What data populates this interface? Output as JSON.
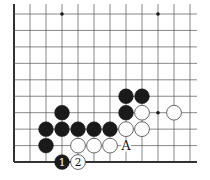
{
  "diagram": {
    "type": "go-board-corner",
    "grid": {
      "x0": 14,
      "y0": 14,
      "dx": 16,
      "dy": 16.45,
      "cols": 12,
      "rows": 10,
      "right_extent": 197,
      "edges": [
        "left",
        "bottom"
      ]
    },
    "colors": {
      "line": "#555555",
      "edge": "#333333",
      "black": "#1a1a1a",
      "white": "#ffffff",
      "star": "#1a1a1a"
    },
    "star_points": [
      [
        3,
        0
      ],
      [
        9,
        0
      ],
      [
        9,
        6
      ]
    ],
    "stones": [
      {
        "color": "black",
        "col": 7,
        "row": 5
      },
      {
        "color": "black",
        "col": 8,
        "row": 5
      },
      {
        "color": "black",
        "col": 7,
        "row": 6
      },
      {
        "color": "white",
        "col": 8,
        "row": 6
      },
      {
        "color": "white",
        "col": 10,
        "row": 6
      },
      {
        "color": "black",
        "col": 3,
        "row": 6
      },
      {
        "color": "black",
        "col": 2,
        "row": 7
      },
      {
        "color": "black",
        "col": 3,
        "row": 7
      },
      {
        "color": "black",
        "col": 4,
        "row": 7
      },
      {
        "color": "black",
        "col": 5,
        "row": 7
      },
      {
        "color": "black",
        "col": 6,
        "row": 7
      },
      {
        "color": "white",
        "col": 7,
        "row": 7
      },
      {
        "color": "white",
        "col": 8,
        "row": 7
      },
      {
        "color": "black",
        "col": 2,
        "row": 8
      },
      {
        "color": "white",
        "col": 4,
        "row": 8
      },
      {
        "color": "white",
        "col": 5,
        "row": 8
      },
      {
        "color": "white",
        "col": 6,
        "row": 8
      },
      {
        "color": "black",
        "col": 3,
        "row": 9,
        "label": "1"
      },
      {
        "color": "white",
        "col": 4,
        "row": 9,
        "label": "2"
      }
    ],
    "markers": [
      {
        "col": 7,
        "row": 8,
        "label": "A"
      }
    ]
  }
}
